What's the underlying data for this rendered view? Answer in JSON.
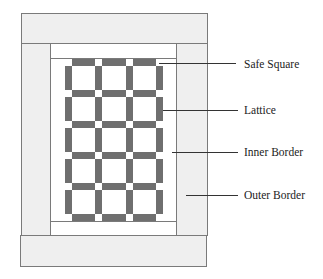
{
  "diagram": {
    "type": "quilt-layout",
    "colors": {
      "outer_border": "#efefef",
      "inner_border": "#ffffff",
      "lattice": "#6f6f6f",
      "block": "#ffffff",
      "safe_square": "#ffffff",
      "outline": "#7a7a7a"
    },
    "grid": {
      "columns": 3,
      "rows": 5
    },
    "labels": [
      {
        "text": "Safe Square"
      },
      {
        "text": "Lattice"
      },
      {
        "text": "Inner Border"
      },
      {
        "text": "Outer Border"
      }
    ]
  }
}
